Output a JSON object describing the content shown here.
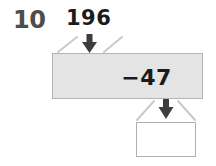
{
  "problem": {
    "number": "10",
    "input_value": "196",
    "operation": "−47",
    "answer_value": ""
  },
  "colors": {
    "problem_number": "#4d4d4d",
    "text": "#1b1b1b",
    "operation_box_fill": "#e4e4e4",
    "operation_box_border": "#b4b4b4",
    "answer_box_fill": "#ffffff",
    "answer_box_border": "#b0b0b0",
    "arrow": "#3d3d3d",
    "bracket_line": "#c9c9c9"
  },
  "diagram": {
    "type": "function-machine",
    "input_label": "196",
    "operation_label": "−47",
    "output_label": "",
    "input_arrow_icon": "arrow-down-icon",
    "output_arrow_icon": "arrow-down-icon"
  }
}
